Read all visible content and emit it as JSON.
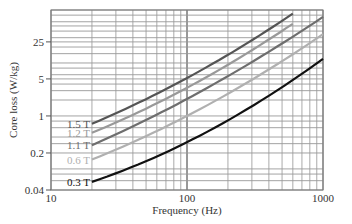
{
  "chart_data": {
    "type": "line",
    "title": "",
    "xlabel": "Frequency (Hz)",
    "ylabel": "Core loss (W/kg)",
    "xscale": "log",
    "yscale": "log",
    "xlim": [
      10,
      1000
    ],
    "ylim": [
      0.04,
      100
    ],
    "xticks": [
      10,
      100,
      1000
    ],
    "xtick_labels": [
      "10",
      "100",
      "1000"
    ],
    "yticks": [
      0.04,
      0.2,
      1,
      5,
      25
    ],
    "ytick_labels": [
      "0.04",
      "0.2",
      "1",
      "5",
      "25"
    ],
    "grid": true,
    "legend_position": "inline-left",
    "series": [
      {
        "name": "1.5 T",
        "label": "1.5 T",
        "color": "#555555",
        "x": [
          20,
          100,
          600
        ],
        "values": [
          0.71,
          5.2,
          85
        ]
      },
      {
        "name": "1.2 T",
        "label": "1.2 T",
        "color": "#999999",
        "x": [
          20,
          100,
          600
        ],
        "values": [
          0.48,
          3.4,
          55
        ]
      },
      {
        "name": "1.1 T",
        "label": "1.1 T",
        "color": "#6e6e6e",
        "x": [
          20,
          100,
          1000
        ],
        "values": [
          0.28,
          2.1,
          74
        ]
      },
      {
        "name": "0.6 T",
        "label": "0.6 T",
        "color": "#b0b0b0",
        "x": [
          20,
          100,
          1000
        ],
        "values": [
          0.15,
          1.0,
          35
        ]
      },
      {
        "name": "0.3 T",
        "label": "0.3 T",
        "color": "#111111",
        "x": [
          20,
          100,
          1000
        ],
        "values": [
          0.057,
          0.32,
          12
        ]
      }
    ]
  }
}
